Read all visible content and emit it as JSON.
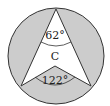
{
  "diagram": {
    "type": "circle-geometry",
    "labels": {
      "inscribed_angle": "62°",
      "center": "C",
      "central_angle": "122°"
    },
    "colors": {
      "shade": "#cccccc",
      "stroke": "#333333",
      "background": "#ffffff"
    },
    "geometry": {
      "circle": {
        "cx": 56,
        "cy": 56,
        "r": 48
      },
      "top_vertex": [
        56,
        9
      ],
      "left_vertex": [
        21,
        86
      ],
      "right_vertex": [
        91,
        86
      ],
      "center_vertex": [
        55,
        66
      ]
    }
  }
}
